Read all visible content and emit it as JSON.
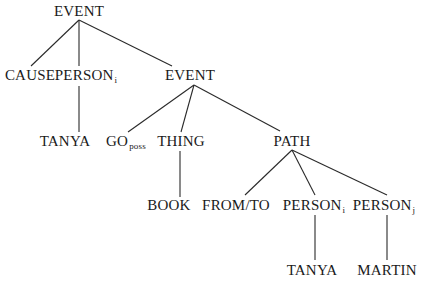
{
  "diagram": {
    "type": "tree",
    "nodes": {
      "root": {
        "label": "EVENT",
        "sub": ""
      },
      "cause": {
        "label": "CAUSE",
        "sub": ""
      },
      "person_i_top": {
        "label": "PERSON",
        "sub": "i"
      },
      "event2": {
        "label": "EVENT",
        "sub": ""
      },
      "tanya_top": {
        "label": "TANYA",
        "sub": ""
      },
      "go": {
        "label": "GO",
        "sub": "poss"
      },
      "thing": {
        "label": "THING",
        "sub": ""
      },
      "path": {
        "label": "PATH",
        "sub": ""
      },
      "book": {
        "label": "BOOK",
        "sub": ""
      },
      "fromto": {
        "label": "FROM/TO",
        "sub": ""
      },
      "person_i": {
        "label": "PERSON",
        "sub": "i"
      },
      "person_j": {
        "label": "PERSON",
        "sub": "j"
      },
      "tanya": {
        "label": "TANYA",
        "sub": ""
      },
      "martin": {
        "label": "MARTIN",
        "sub": ""
      }
    },
    "edges": [
      [
        "root",
        "cause"
      ],
      [
        "root",
        "person_i_top"
      ],
      [
        "root",
        "event2"
      ],
      [
        "person_i_top",
        "tanya_top"
      ],
      [
        "event2",
        "go"
      ],
      [
        "event2",
        "thing"
      ],
      [
        "event2",
        "path"
      ],
      [
        "thing",
        "book"
      ],
      [
        "path",
        "fromto"
      ],
      [
        "path",
        "person_i"
      ],
      [
        "path",
        "person_j"
      ],
      [
        "person_i",
        "tanya"
      ],
      [
        "person_j",
        "martin"
      ]
    ],
    "line_color": "#2a2a2a",
    "text_color": "#1a1a1a"
  }
}
